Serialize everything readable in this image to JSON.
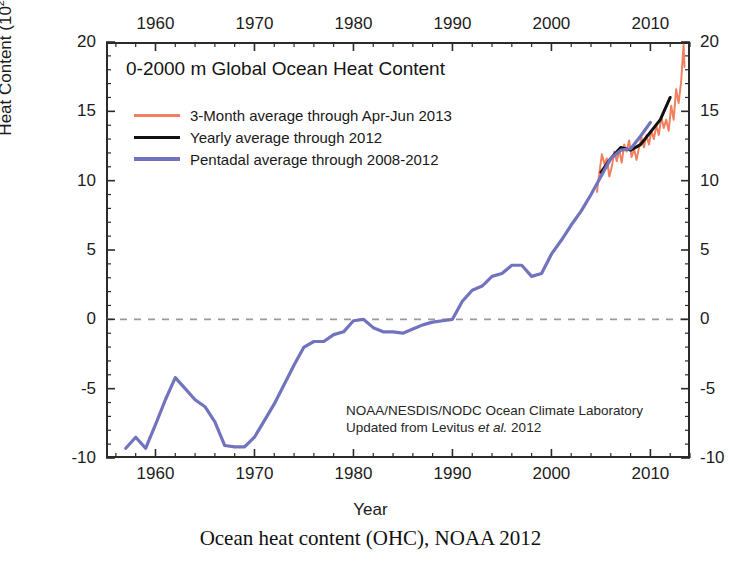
{
  "chart_data": {
    "type": "line",
    "title": "0-2000 m Global Ocean Heat Content",
    "caption": "Ocean heat content (OHC), NOAA 2012",
    "xlabel": "Year",
    "ylabel_text": "Heat Content (10",
    "ylabel_sup": "22",
    "ylabel_tail": " Joules)",
    "xlim": [
      1955,
      2014
    ],
    "ylim": [
      -10,
      20
    ],
    "xticks": [
      1960,
      1970,
      1980,
      1990,
      2000,
      2010
    ],
    "xtick_minor_step": 2,
    "yticks": [
      -10,
      -5,
      0,
      5,
      10,
      15,
      20
    ],
    "ytick_minor_step": 1,
    "grid": false,
    "zero_line": true,
    "zero_line_value": 0,
    "zero_line_style": "dashed",
    "zero_line_color": "#9a9a9a",
    "axes_mirrored": true,
    "legend_position": "upper-left-inside",
    "credit_line1": "NOAA/NESDIS/NODC Ocean Climate Laboratory",
    "credit_line2_pre": "Updated from Levitus ",
    "credit_line2_italic": "et al.",
    "credit_line2_post": " 2012",
    "series": [
      {
        "name": "3-Month average through Apr-Jun 2013",
        "color": "#F0805F",
        "width": 2.0,
        "x": [
          2004.6,
          2004.85,
          2005.1,
          2005.35,
          2005.6,
          2005.85,
          2006.1,
          2006.35,
          2006.6,
          2006.85,
          2007.1,
          2007.35,
          2007.6,
          2007.85,
          2008.1,
          2008.35,
          2008.6,
          2008.85,
          2009.1,
          2009.35,
          2009.6,
          2009.85,
          2010.1,
          2010.35,
          2010.6,
          2010.85,
          2011.1,
          2011.35,
          2011.6,
          2011.85,
          2012.1,
          2012.35,
          2012.6,
          2012.85,
          2013.1,
          2013.35,
          2013.45
        ],
        "y": [
          9.2,
          10.6,
          11.9,
          11.2,
          11.6,
          10.3,
          11.0,
          12.1,
          11.4,
          12.2,
          11.3,
          12.6,
          12.1,
          12.9,
          11.7,
          12.3,
          11.5,
          12.4,
          13.1,
          12.4,
          13.3,
          12.6,
          13.6,
          13.0,
          14.0,
          13.3,
          14.6,
          13.8,
          14.4,
          13.6,
          15.4,
          14.4,
          16.6,
          15.6,
          17.1,
          19.8,
          18.2
        ]
      },
      {
        "name": "Yearly average through 2012",
        "color": "#111111",
        "width": 3.0,
        "x": [
          2005,
          2006,
          2007,
          2008,
          2009,
          2010,
          2011,
          2012
        ],
        "y": [
          10.6,
          11.6,
          12.4,
          12.2,
          12.6,
          13.5,
          14.4,
          16.0
        ]
      },
      {
        "name": "Pentadal average through 2008-2012",
        "color": "#7273BE",
        "width": 3.2,
        "x": [
          1957,
          1958,
          1959,
          1960,
          1961,
          1962,
          1963,
          1964,
          1965,
          1966,
          1967,
          1968,
          1969,
          1970,
          1971,
          1972,
          1973,
          1974,
          1975,
          1976,
          1977,
          1978,
          1979,
          1980,
          1981,
          1982,
          1983,
          1984,
          1985,
          1986,
          1987,
          1988,
          1989,
          1990,
          1991,
          1992,
          1993,
          1994,
          1995,
          1996,
          1997,
          1998,
          1999,
          2000,
          2001,
          2002,
          2003,
          2004,
          2005,
          2006,
          2007,
          2008,
          2009,
          2010
        ],
        "y": [
          -9.3,
          -8.5,
          -9.3,
          -7.6,
          -5.8,
          -4.2,
          -5.0,
          -5.8,
          -6.3,
          -7.4,
          -9.1,
          -9.2,
          -9.2,
          -8.5,
          -7.3,
          -6.1,
          -4.7,
          -3.3,
          -2.0,
          -1.6,
          -1.6,
          -1.1,
          -0.9,
          -0.1,
          0.0,
          -0.6,
          -0.9,
          -0.9,
          -1.0,
          -0.7,
          -0.4,
          -0.2,
          -0.1,
          0.0,
          1.3,
          2.1,
          2.4,
          3.1,
          3.3,
          3.9,
          3.9,
          3.1,
          3.3,
          4.7,
          5.7,
          6.8,
          7.8,
          9.0,
          10.3,
          11.6,
          12.2,
          12.3,
          13.2,
          14.2
        ]
      }
    ]
  }
}
